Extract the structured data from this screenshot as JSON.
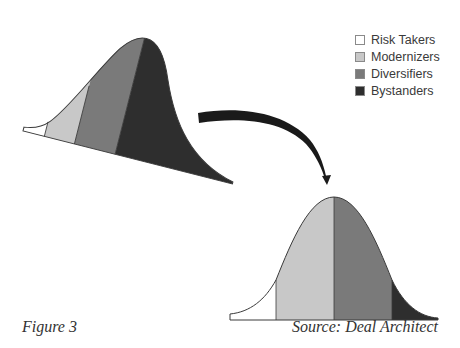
{
  "legend": {
    "items": [
      {
        "label": "Risk Takers",
        "color": "#ffffff"
      },
      {
        "label": "Modernizers",
        "color": "#c8c8c8"
      },
      {
        "label": "Diversifiers",
        "color": "#7a7a7a"
      },
      {
        "label": "Bystanders",
        "color": "#2e2e2e"
      }
    ]
  },
  "curves": {
    "before": {
      "description": "Tilted bell curve — current distribution, skewed toward Bystanders",
      "segments": [
        "Risk Takers",
        "Modernizers",
        "Diversifiers",
        "Bystanders"
      ]
    },
    "after": {
      "description": "Upright bell curve — target distribution, centered on Modernizers/Diversifiers",
      "segments": [
        "Risk Takers",
        "Modernizers",
        "Diversifiers",
        "Bystanders"
      ]
    }
  },
  "arrow": {
    "from": "before",
    "to": "after"
  },
  "captions": {
    "figure": "Figure 3",
    "source": "Source: Deal Architect"
  }
}
